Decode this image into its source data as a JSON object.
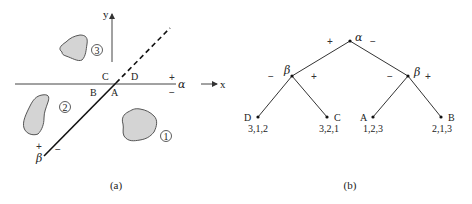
{
  "figure_a": {
    "caption": "(a)",
    "axes": {
      "x_label": "x",
      "y_label": "y"
    },
    "alpha_line": {
      "label": "α",
      "plus": "+",
      "minus": "−"
    },
    "beta_line": {
      "label": "β",
      "plus": "+",
      "minus": "−"
    },
    "quadrant_labels": [
      "A",
      "B",
      "C",
      "D"
    ],
    "regions": [
      {
        "id": "1",
        "label": "1"
      },
      {
        "id": "2",
        "label": "2"
      },
      {
        "id": "3",
        "label": "3"
      }
    ]
  },
  "figure_b": {
    "caption": "(b)",
    "root": {
      "label": "α",
      "left_sign": "+",
      "right_sign": "−"
    },
    "left_node": {
      "label": "β",
      "left_sign": "−",
      "right_sign": "+"
    },
    "right_node": {
      "label": "β",
      "left_sign": "−",
      "right_sign": "+"
    },
    "leaves": [
      {
        "label": "D",
        "order": "3,1,2"
      },
      {
        "label": "C",
        "order": "3,2,1"
      },
      {
        "label": "A",
        "order": "1,2,3"
      },
      {
        "label": "B",
        "order": "2,1,3"
      }
    ]
  }
}
